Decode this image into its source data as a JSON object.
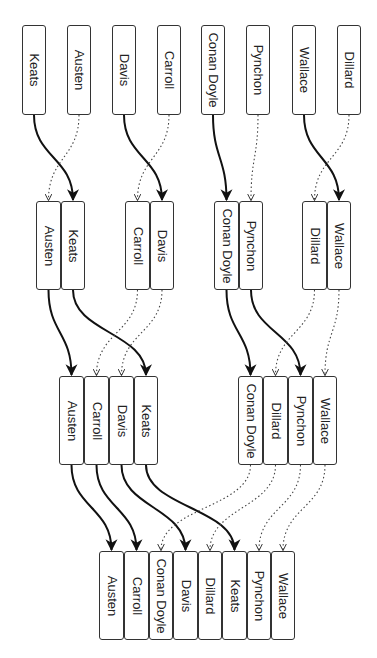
{
  "diagram": {
    "type": "merge-sort",
    "colors": {
      "stroke": "#111111",
      "box_border": "#333333",
      "text": "#222222",
      "background": "#ffffff"
    },
    "levels": [
      {
        "y": 25,
        "h": 90,
        "boxes": [
          {
            "label": "Keats",
            "x": 22,
            "w": 24
          },
          {
            "label": "Austen",
            "x": 67,
            "w": 24
          },
          {
            "label": "Davis",
            "x": 112,
            "w": 24
          },
          {
            "label": "Carroll",
            "x": 157,
            "w": 24
          },
          {
            "label": "Conan Doyle",
            "x": 201,
            "w": 24
          },
          {
            "label": "Pynchon",
            "x": 246,
            "w": 24
          },
          {
            "label": "Wallace",
            "x": 292,
            "w": 24
          },
          {
            "label": "Dillard",
            "x": 337,
            "w": 24
          }
        ]
      },
      {
        "y": 201,
        "h": 89,
        "boxes": [
          {
            "label": "Austen",
            "x": 36,
            "w": 25
          },
          {
            "label": "Keats",
            "x": 61,
            "w": 24
          },
          {
            "label": "Carroll",
            "x": 125,
            "w": 25
          },
          {
            "label": "Davis",
            "x": 150,
            "w": 24
          },
          {
            "label": "Conan Doyle",
            "x": 214,
            "w": 25
          },
          {
            "label": "Pynchon",
            "x": 239,
            "w": 24
          },
          {
            "label": "Dillard",
            "x": 302,
            "w": 25
          },
          {
            "label": "Wallace",
            "x": 327,
            "w": 24
          }
        ]
      },
      {
        "y": 376,
        "h": 89,
        "boxes": [
          {
            "label": "Austen",
            "x": 59,
            "w": 25
          },
          {
            "label": "Carroll",
            "x": 84,
            "w": 25
          },
          {
            "label": "Davis",
            "x": 109,
            "w": 25
          },
          {
            "label": "Keats",
            "x": 134,
            "w": 24
          },
          {
            "label": "Conan Doyle",
            "x": 238,
            "w": 25
          },
          {
            "label": "Dillard",
            "x": 263,
            "w": 25
          },
          {
            "label": "Pynchon",
            "x": 288,
            "w": 25
          },
          {
            "label": "Wallace",
            "x": 313,
            "w": 24
          }
        ]
      },
      {
        "y": 551,
        "h": 89,
        "boxes": [
          {
            "label": "Austen",
            "x": 99,
            "w": 25
          },
          {
            "label": "Carroll",
            "x": 124,
            "w": 25
          },
          {
            "label": "Conan Doyle",
            "x": 149,
            "w": 24
          },
          {
            "label": "Davis",
            "x": 173,
            "w": 25
          },
          {
            "label": "Dillard",
            "x": 198,
            "w": 24
          },
          {
            "label": "Keats",
            "x": 222,
            "w": 25
          },
          {
            "label": "Pynchon",
            "x": 247,
            "w": 24
          },
          {
            "label": "Wallace",
            "x": 271,
            "w": 24
          }
        ]
      }
    ],
    "edges": [
      {
        "from": [
          0,
          0
        ],
        "to": [
          1,
          1
        ],
        "style": "solid"
      },
      {
        "from": [
          0,
          1
        ],
        "to": [
          1,
          0
        ],
        "style": "dotted"
      },
      {
        "from": [
          0,
          2
        ],
        "to": [
          1,
          3
        ],
        "style": "solid"
      },
      {
        "from": [
          0,
          3
        ],
        "to": [
          1,
          2
        ],
        "style": "dotted"
      },
      {
        "from": [
          0,
          4
        ],
        "to": [
          1,
          4
        ],
        "style": "solid"
      },
      {
        "from": [
          0,
          5
        ],
        "to": [
          1,
          5
        ],
        "style": "dotted"
      },
      {
        "from": [
          0,
          6
        ],
        "to": [
          1,
          7
        ],
        "style": "solid"
      },
      {
        "from": [
          0,
          7
        ],
        "to": [
          1,
          6
        ],
        "style": "dotted"
      },
      {
        "from": [
          1,
          0
        ],
        "to": [
          2,
          0
        ],
        "style": "solid"
      },
      {
        "from": [
          1,
          1
        ],
        "to": [
          2,
          3
        ],
        "style": "solid"
      },
      {
        "from": [
          1,
          2
        ],
        "to": [
          2,
          1
        ],
        "style": "dotted"
      },
      {
        "from": [
          1,
          3
        ],
        "to": [
          2,
          2
        ],
        "style": "dotted"
      },
      {
        "from": [
          1,
          4
        ],
        "to": [
          2,
          4
        ],
        "style": "solid"
      },
      {
        "from": [
          1,
          5
        ],
        "to": [
          2,
          6
        ],
        "style": "solid"
      },
      {
        "from": [
          1,
          6
        ],
        "to": [
          2,
          5
        ],
        "style": "dotted"
      },
      {
        "from": [
          1,
          7
        ],
        "to": [
          2,
          7
        ],
        "style": "dotted"
      },
      {
        "from": [
          2,
          0
        ],
        "to": [
          3,
          0
        ],
        "style": "solid"
      },
      {
        "from": [
          2,
          1
        ],
        "to": [
          3,
          1
        ],
        "style": "solid"
      },
      {
        "from": [
          2,
          2
        ],
        "to": [
          3,
          3
        ],
        "style": "solid"
      },
      {
        "from": [
          2,
          3
        ],
        "to": [
          3,
          5
        ],
        "style": "solid"
      },
      {
        "from": [
          2,
          4
        ],
        "to": [
          3,
          2
        ],
        "style": "dotted"
      },
      {
        "from": [
          2,
          5
        ],
        "to": [
          3,
          4
        ],
        "style": "dotted"
      },
      {
        "from": [
          2,
          6
        ],
        "to": [
          3,
          6
        ],
        "style": "dotted"
      },
      {
        "from": [
          2,
          7
        ],
        "to": [
          3,
          7
        ],
        "style": "dotted"
      }
    ]
  }
}
